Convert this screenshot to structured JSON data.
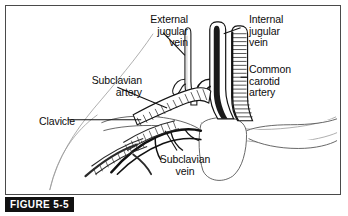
{
  "figure": {
    "caption": "FIGURE 5-5",
    "colors": {
      "ink": "#0d0d0d",
      "frame": "#4a4a4a",
      "caption_bar": "#111111",
      "caption_text": "#ffffff",
      "faint_contour": "#9a9a9a",
      "background": "#ffffff"
    }
  },
  "labels": [
    {
      "id": "external-jugular-vein",
      "text": "External\njugular\nvein",
      "align": "right"
    },
    {
      "id": "internal-jugular-vein",
      "text": "Internal\njugular\nvein",
      "align": "left"
    },
    {
      "id": "common-carotid-artery",
      "text": "Common\ncarotid\nartery",
      "align": "left"
    },
    {
      "id": "subclavian-artery",
      "text": "Subclavian\nartery",
      "align": "right"
    },
    {
      "id": "clavicle",
      "text": "Clavicle",
      "align": "right"
    },
    {
      "id": "subclavian-vein",
      "text": "Subclavian\nvein",
      "align": "center"
    }
  ]
}
